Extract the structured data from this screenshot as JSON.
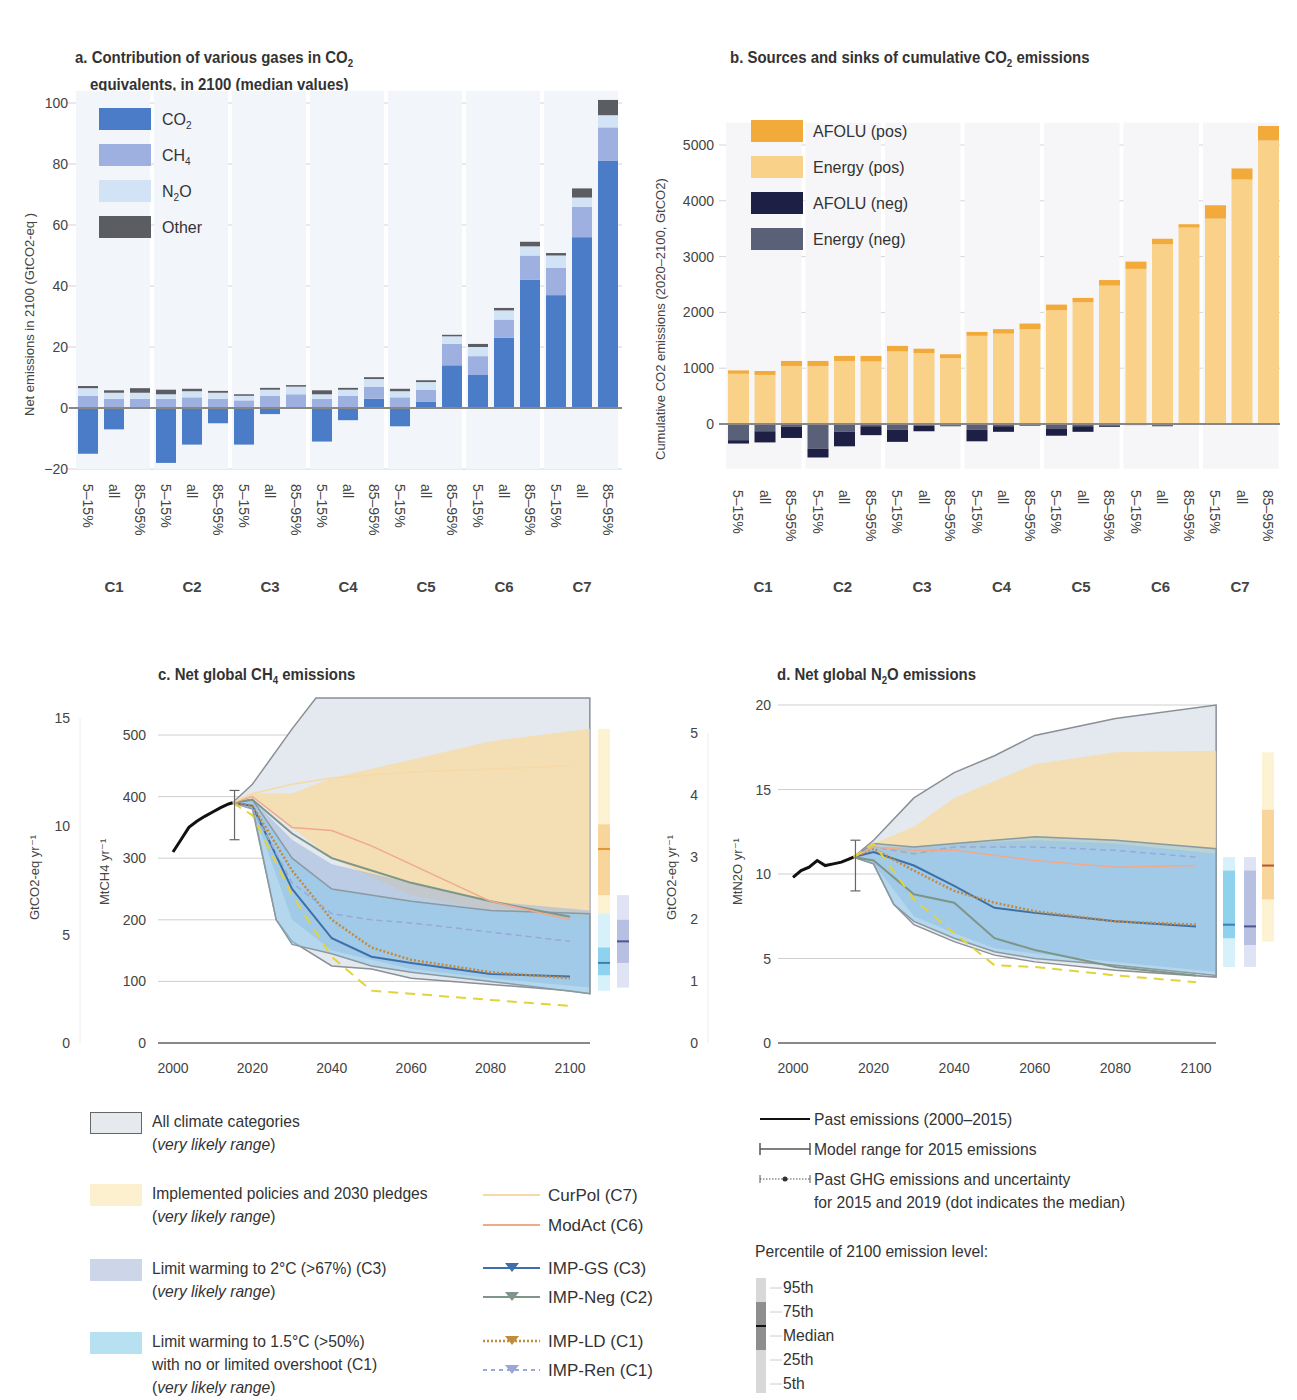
{
  "chart_data": [
    {
      "id": "a",
      "type": "bar",
      "stacked": true,
      "title": "a. Contribution of various gases in CO2 equivalents, in 2100 (median values)",
      "title_line1": "a. Contribution of various gases in CO",
      "title_sub": "2",
      "title_line2": "equivalents, in 2100 (median values)",
      "ylabel": "Net emissions in 2100 (GtCO2-eq )",
      "ylim": [
        -20,
        100
      ],
      "yticks": [
        "100",
        "80",
        "60",
        "40",
        "20",
        "0",
        "−20"
      ],
      "grid": true,
      "legend": [
        {
          "name": "CO2",
          "label": "CO",
          "sub": "2",
          "color": "#4a7cc7"
        },
        {
          "name": "CH4",
          "label": "CH",
          "sub": "4",
          "color": "#9db0e0"
        },
        {
          "name": "N2O",
          "label": "N",
          "sub": "2",
          "label2": "O",
          "color": "#d3e3f6"
        },
        {
          "name": "Other",
          "label": "Other",
          "color": "#5b5d62"
        }
      ],
      "groups": [
        "C1",
        "C2",
        "C3",
        "C4",
        "C5",
        "C6",
        "C7"
      ],
      "categories": [
        "5–15%",
        "all",
        "85–95%",
        "5–15%",
        "all",
        "85–95%",
        "5–15%",
        "all",
        "85–95%",
        "5–15%",
        "all",
        "85–95%",
        "5–15%",
        "all",
        "85–95%",
        "5–15%",
        "all",
        "85–95%",
        "5–15%",
        "all",
        "85–95%"
      ],
      "series": [
        {
          "name": "CO2",
          "values": [
            -15,
            -7,
            0,
            -18,
            -12,
            -5,
            -12,
            -2,
            0,
            -11,
            -4,
            3,
            -6,
            2,
            14,
            11,
            23,
            42,
            37,
            56,
            81
          ]
        },
        {
          "name": "CH4",
          "values": [
            4,
            3,
            3,
            3,
            3.5,
            3,
            2.5,
            4,
            4.5,
            3,
            4,
            4,
            3.5,
            4,
            7,
            6,
            6,
            8,
            9,
            10,
            11
          ]
        },
        {
          "name": "N2O",
          "values": [
            2.5,
            2,
            2,
            1.5,
            2,
            2,
            1.5,
            2,
            2.5,
            1.5,
            2,
            2.5,
            2,
            2.5,
            2.5,
            3,
            3,
            3,
            4,
            3,
            4
          ]
        },
        {
          "name": "Other",
          "values": [
            0.7,
            0.8,
            1.5,
            1.5,
            0.8,
            0.6,
            0.5,
            0.6,
            0.5,
            1.3,
            0.6,
            0.6,
            0.8,
            0.6,
            0.5,
            1.0,
            0.8,
            1.5,
            0.8,
            3,
            5
          ]
        }
      ]
    },
    {
      "id": "b",
      "type": "bar",
      "stacked": true,
      "title": "b. Sources and sinks of cumulative CO2 emissions",
      "title_pre": "b. Sources and sinks of cumulative CO",
      "title_sub": "2",
      "title_post": " emissions",
      "ylabel": "Cumulative CO2 emissions (2020–2100, GtCO2)",
      "ylim": [
        -800,
        5300
      ],
      "yticks": [
        "5000",
        "4000",
        "3000",
        "2000",
        "1000",
        "0"
      ],
      "grid": true,
      "legend": [
        {
          "name": "AFOLU (pos)",
          "color": "#f2aa3a"
        },
        {
          "name": "Energy (pos)",
          "color": "#f9d189"
        },
        {
          "name": "AFOLU (neg)",
          "color": "#1d1f44"
        },
        {
          "name": "Energy (neg)",
          "color": "#5b6079"
        }
      ],
      "groups": [
        "C1",
        "C2",
        "C3",
        "C4",
        "C5",
        "C6",
        "C7"
      ],
      "categories": [
        "5–15%",
        "all",
        "85–95%",
        "5–15%",
        "all",
        "85–95%",
        "5–15%",
        "all",
        "85–95%",
        "5–15%",
        "all",
        "85–95%",
        "5–15%",
        "all",
        "85–95%",
        "5–15%",
        "all",
        "85–95%",
        "5–15%",
        "all",
        "85–95%"
      ],
      "series": [
        {
          "name": "Energy (pos)",
          "values": [
            900,
            880,
            1040,
            1040,
            1130,
            1120,
            1300,
            1270,
            1180,
            1580,
            1620,
            1700,
            2040,
            2180,
            2480,
            2780,
            3220,
            3520,
            3680,
            4380,
            5080
          ]
        },
        {
          "name": "AFOLU (pos)",
          "values": [
            60,
            70,
            90,
            90,
            90,
            100,
            100,
            80,
            70,
            70,
            80,
            100,
            100,
            80,
            100,
            130,
            100,
            60,
            240,
            200,
            260
          ]
        },
        {
          "name": "Energy (neg)",
          "values": [
            -290,
            -130,
            -50,
            -440,
            -140,
            -40,
            -100,
            -30,
            -30,
            -100,
            -40,
            -20,
            -90,
            -40,
            -30,
            -20,
            -30,
            -10,
            -10,
            -10,
            -10
          ]
        },
        {
          "name": "AFOLU (neg)",
          "values": [
            -60,
            -200,
            -200,
            -160,
            -260,
            -160,
            -220,
            -100,
            -10,
            -210,
            -100,
            -10,
            -120,
            -100,
            -20,
            0,
            -10,
            0,
            0,
            0,
            0
          ]
        }
      ]
    },
    {
      "id": "c",
      "type": "area",
      "title": "c. Net global CH4 emissions",
      "title_pre": "c. Net global CH",
      "title_sub": "4",
      "title_post": " emissions",
      "ylabel_left": "GtCO2-eq yr⁻¹",
      "ylabel_right": "MtCH4 yr⁻¹",
      "x_ticks": [
        "2000",
        "2020",
        "2040",
        "2060",
        "2080",
        "2100"
      ],
      "y_ticks_mt": [
        "500",
        "400",
        "300",
        "200",
        "100",
        "0"
      ],
      "y_ticks_gt": [
        "15",
        "10",
        "5",
        "0"
      ],
      "xlim": [
        1996,
        2105
      ],
      "ylim": [
        0,
        550
      ],
      "past_emissions": {
        "x": [
          2000,
          2002,
          2004,
          2006,
          2008,
          2010,
          2012,
          2014,
          2015
        ],
        "y": [
          310,
          330,
          350,
          360,
          368,
          375,
          382,
          388,
          390
        ]
      },
      "model_range_2015": [
        330,
        410
      ],
      "lines": [
        {
          "name": "IMP-GS (C3)",
          "x": [
            2015,
            2020,
            2030,
            2040,
            2050,
            2060,
            2080,
            2100
          ],
          "y": [
            390,
            385,
            250,
            170,
            140,
            130,
            112,
            108
          ]
        },
        {
          "name": "IMP-Neg (C2)",
          "x": [
            2015,
            2020,
            2030,
            2040,
            2050,
            2060,
            2080,
            2100
          ],
          "y": [
            390,
            395,
            340,
            300,
            280,
            260,
            230,
            205
          ]
        },
        {
          "name": "IMP-LD (C1)",
          "x": [
            2015,
            2020,
            2030,
            2040,
            2050,
            2060,
            2080,
            2100
          ],
          "y": [
            390,
            385,
            280,
            200,
            155,
            135,
            115,
            105
          ]
        },
        {
          "name": "IMP-Ren (C1)",
          "x": [
            2015,
            2020,
            2030,
            2040,
            2050,
            2060,
            2080,
            2100
          ],
          "y": [
            390,
            380,
            260,
            210,
            200,
            195,
            180,
            165
          ]
        },
        {
          "name": "ModAct (C6)",
          "x": [
            2015,
            2020,
            2030,
            2040,
            2050,
            2060,
            2080,
            2100
          ],
          "y": [
            390,
            400,
            350,
            345,
            320,
            290,
            230,
            200
          ]
        },
        {
          "name": "CurPol (C7)",
          "x": [
            2015,
            2020,
            2030,
            2040,
            2060,
            2080,
            2100
          ],
          "y": [
            390,
            405,
            420,
            430,
            440,
            445,
            450
          ]
        },
        {
          "name": "1.5C-lowest",
          "x": [
            2015,
            2020,
            2030,
            2040,
            2050,
            2060,
            2080,
            2100
          ],
          "y": [
            390,
            370,
            240,
            140,
            85,
            80,
            70,
            60
          ]
        }
      ],
      "percentile_bars": [
        {
          "name": "Implemented policies",
          "p5": 160,
          "p25": 240,
          "median": 315,
          "p75": 355,
          "p95": 510
        },
        {
          "name": "C1",
          "p5": 85,
          "p25": 110,
          "median": 130,
          "p75": 155,
          "p95": 210
        },
        {
          "name": "C3",
          "p5": 90,
          "p25": 130,
          "median": 165,
          "p75": 200,
          "p95": 240
        }
      ]
    },
    {
      "id": "d",
      "type": "area",
      "title": "d. Net global N2O emissions",
      "title_pre": "d. Net global N",
      "title_sub": "2",
      "title_post": "O emissions",
      "ylabel_left": "GtCO2-eq yr⁻¹",
      "ylabel_right": "MtN2O yr⁻¹",
      "x_ticks": [
        "2000",
        "2020",
        "2040",
        "2060",
        "2080",
        "2100"
      ],
      "y_ticks_mt": [
        "20",
        "15",
        "10",
        "5",
        "0"
      ],
      "y_ticks_gt": [
        "5",
        "4",
        "3",
        "2",
        "1",
        "0"
      ],
      "xlim": [
        1996,
        2105
      ],
      "ylim": [
        0,
        20
      ],
      "past_emissions": {
        "x": [
          2000,
          2002,
          2004,
          2006,
          2008,
          2010,
          2012,
          2014,
          2015
        ],
        "y": [
          9.8,
          10.2,
          10.4,
          10.8,
          10.5,
          10.6,
          10.7,
          10.9,
          11.0
        ]
      },
      "model_range_2015": [
        9,
        12
      ],
      "lines": [
        {
          "name": "IMP-GS (C3)",
          "x": [
            2015,
            2020,
            2030,
            2040,
            2050,
            2060,
            2080,
            2100
          ],
          "y": [
            11,
            11.3,
            10.5,
            9.3,
            8.0,
            7.7,
            7.2,
            6.9
          ]
        },
        {
          "name": "IMP-Neg (C2)",
          "x": [
            2015,
            2020,
            2030,
            2040,
            2050,
            2060,
            2080,
            2100
          ],
          "y": [
            11,
            10.8,
            8.8,
            8.3,
            6.2,
            5.5,
            4.5,
            4.0
          ]
        },
        {
          "name": "IMP-LD (C1)",
          "x": [
            2015,
            2020,
            2030,
            2040,
            2050,
            2060,
            2080,
            2100
          ],
          "y": [
            11,
            11.5,
            10.2,
            9.0,
            8.3,
            7.8,
            7.2,
            7.0
          ]
        },
        {
          "name": "IMP-Ren (C1)",
          "x": [
            2015,
            2020,
            2030,
            2040,
            2060,
            2080,
            2100
          ],
          "y": [
            11,
            11.6,
            11.2,
            11.6,
            11.6,
            11.4,
            11.0
          ]
        },
        {
          "name": "ModAct (C6)",
          "x": [
            2015,
            2020,
            2030,
            2040,
            2060,
            2080,
            2100
          ],
          "y": [
            11,
            11.6,
            11.4,
            11.4,
            10.8,
            10.4,
            10.5
          ]
        },
        {
          "name": "1.5C-lowest",
          "x": [
            2015,
            2020,
            2030,
            2040,
            2050,
            2060,
            2080,
            2100
          ],
          "y": [
            11,
            11.8,
            8.5,
            6.5,
            4.6,
            4.5,
            4.0,
            3.6
          ]
        }
      ],
      "percentile_bars": [
        {
          "name": "C1",
          "p5": 4.5,
          "p25": 6.2,
          "median": 7.0,
          "p75": 10.2,
          "p95": 11.0
        },
        {
          "name": "C3",
          "p5": 4.5,
          "p25": 5.8,
          "median": 6.9,
          "p75": 10.2,
          "p95": 11.0
        },
        {
          "name": "Implemented policies",
          "p5": 6.0,
          "p25": 8.5,
          "median": 10.5,
          "p75": 13.8,
          "p95": 17.2
        }
      ]
    }
  ],
  "legend_bottom": {
    "areas": [
      {
        "label": "All climate categories",
        "sub": "very likely range",
        "color": "#e6eaee",
        "border": "#555"
      },
      {
        "label": "Implemented policies and 2030 pledges",
        "sub": "very likely range",
        "color": "#fdf0cf"
      },
      {
        "label": "Limit warming to 2°C (>67%) (C3)",
        "sub": "very likely range",
        "color": "#cdd6e8"
      },
      {
        "label": "Limit warming to 1.5°C (>50%)",
        "label2": "with no or limited overshoot (C1)",
        "sub": "very likely range",
        "color": "#b7e1f1"
      }
    ],
    "lines": [
      {
        "label": "CurPol (C7)",
        "color": "#f6d9a5",
        "style": "solid"
      },
      {
        "label": "ModAct (C6)",
        "color": "#f0a98a",
        "style": "solid"
      },
      {
        "label": "IMP-GS (C3)",
        "color": "#3f6fa8",
        "style": "solid-marker"
      },
      {
        "label": "IMP-Neg (C2)",
        "color": "#7e9688",
        "style": "solid-marker"
      },
      {
        "label": "IMP-LD (C1)",
        "color": "#c48a3c",
        "style": "dotted-marker"
      },
      {
        "label": "IMP-Ren (C1)",
        "color": "#9aa8d8",
        "style": "dashed-marker"
      }
    ],
    "past": [
      {
        "label": "Past emissions (2000–2015)"
      },
      {
        "label": "Model range for 2015 emissions"
      },
      {
        "label": "Past GHG emissions and uncertainty",
        "label2": "for 2015 and 2019 (dot indicates the median)"
      }
    ],
    "percentile_title": "Percentile of 2100 emission level:",
    "percentiles": [
      "95th",
      "75th",
      "Median",
      "25th",
      "5th"
    ]
  }
}
